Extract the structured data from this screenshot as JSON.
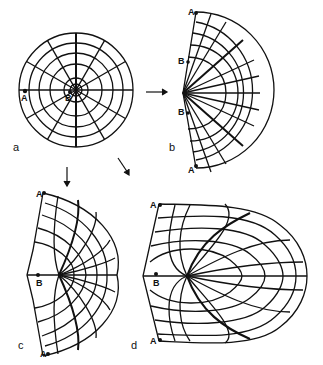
{
  "figure": {
    "panels": [
      {
        "id": "a",
        "label": "a",
        "points": [
          "A",
          "B"
        ],
        "shape": "full circle with polar grid (concentric circles and radial lines)"
      },
      {
        "id": "b",
        "label": "b",
        "points": [
          "A",
          "B",
          "B",
          "A"
        ],
        "shape": "half-disk; radial lines fan from left apex"
      },
      {
        "id": "c",
        "label": "c",
        "points": [
          "A",
          "B",
          "A"
        ],
        "shape": "deformed half-disk with curvilinear grid"
      },
      {
        "id": "d",
        "label": "d",
        "points": [
          "A",
          "B",
          "A"
        ],
        "shape": "elongated egg-shaped deformed grid"
      }
    ],
    "arrows": [
      {
        "from": "a",
        "to": "b",
        "direction": "right"
      },
      {
        "from": "a",
        "to": "c",
        "direction": "down"
      },
      {
        "from": "a",
        "to": "d",
        "direction": "down-right"
      }
    ],
    "colors": {
      "ink": "#111111",
      "background": "#ffffff"
    }
  }
}
